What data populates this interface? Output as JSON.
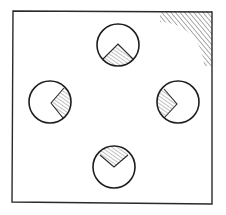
{
  "figure": {
    "type": "technical-line-drawing",
    "stroke_color": "#2a2a2a",
    "hatch_color": "#555555",
    "background": "#ffffff",
    "frame": {
      "x": 12,
      "y": 11,
      "width": 200,
      "height": 192
    },
    "corner_hatch": {
      "corner": "top-right"
    },
    "dials": [
      {
        "name": "top",
        "cx": 118,
        "cy": 45,
        "r": 21,
        "wedge_direction": "down"
      },
      {
        "name": "left",
        "cx": 50,
        "cy": 102,
        "r": 21,
        "wedge_direction": "right"
      },
      {
        "name": "right",
        "cx": 178,
        "cy": 102,
        "r": 21,
        "wedge_direction": "left"
      },
      {
        "name": "bottom",
        "cx": 114,
        "cy": 167,
        "r": 21,
        "wedge_direction": "up"
      }
    ]
  }
}
